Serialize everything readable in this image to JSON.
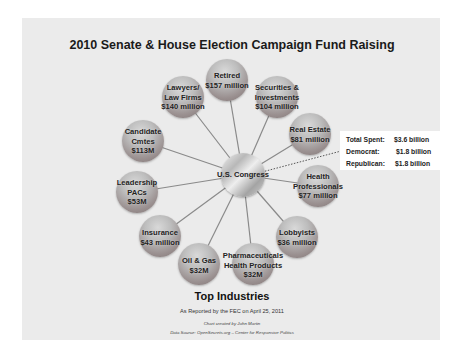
{
  "title": "2010 Senate & House Election Campaign Fund Raising",
  "hub": {
    "label": "U.S. Congress"
  },
  "nodes": [
    {
      "name": "Retired",
      "lines": [
        "Retired",
        "$157 million"
      ],
      "amount": "$157 million"
    },
    {
      "name": "Securities & Investments",
      "lines": [
        "Securities &",
        "Investments",
        "$104 million"
      ],
      "amount": "$104 million"
    },
    {
      "name": "Real Estate",
      "lines": [
        "Real Estate",
        "$81 million"
      ],
      "amount": "$81 million"
    },
    {
      "name": "Health Professionals",
      "lines": [
        "Health",
        "Professionals",
        "$77 million"
      ],
      "amount": "$77 million"
    },
    {
      "name": "Lobbyists",
      "lines": [
        "Lobbyists",
        "$36 million"
      ],
      "amount": "$36 million"
    },
    {
      "name": "Pharmaceuticals Health Products",
      "lines": [
        "Pharmaceuticals",
        "Health Products",
        "$32M"
      ],
      "amount": "$32M"
    },
    {
      "name": "Oil & Gas",
      "lines": [
        "Oil & Gas",
        "$32M"
      ],
      "amount": "$32M"
    },
    {
      "name": "Insurance",
      "lines": [
        "Insurance",
        "$43 million"
      ],
      "amount": "$43 million"
    },
    {
      "name": "Leadership PACs",
      "lines": [
        "Leadership",
        "PACs",
        "$53M"
      ],
      "amount": "$53M"
    },
    {
      "name": "Candidate Cmtes",
      "lines": [
        "Candidate",
        "Cmtes",
        "$113M"
      ],
      "amount": "$113M"
    },
    {
      "name": "Lawyers/Law Firms",
      "lines": [
        "Lawyers/",
        "Law Firms",
        "$140 million"
      ],
      "amount": "$140 million"
    }
  ],
  "callout": {
    "rows": [
      {
        "key": "Total Spent:",
        "value": "$3.6 billion"
      },
      {
        "key": "Democrat:",
        "value": "$1.8 billion"
      },
      {
        "key": "Republican:",
        "value": "$1.8 billion"
      }
    ]
  },
  "footer": {
    "heading": "Top Industries",
    "reported": "As Reported by the FEC on April 25, 2011",
    "credit": "Chart created by John Martin",
    "source": "Data Source: OpenSecrets.org – Center for Responsive Politics"
  },
  "colors": {
    "slide_bg": "#ebebeb",
    "node_dark": "#7e7272",
    "node_light": "#d9d9d9",
    "spoke": "#8a8a8a",
    "text": "#222222"
  }
}
